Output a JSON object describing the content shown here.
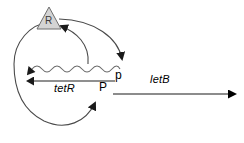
{
  "figure": {
    "kind": "gene-regulatory-network-diagram",
    "background_color": "#ffffff"
  },
  "nodes": {
    "repressor": {
      "label": "R",
      "shape": "triangle",
      "fill_color": "#d4d4d4",
      "stroke_color": "#555555",
      "text_color": "#3a3a3a",
      "name": "repressor-protein-R"
    },
    "promoter": {
      "label": "P",
      "name": "promoter-P"
    },
    "terminator": {
      "label": "q",
      "name": "terminator-symbol"
    }
  },
  "genes": [
    {
      "label": "tetR",
      "style": "italic",
      "line_color": "#8f8f8f",
      "name": "gene-tetR"
    },
    {
      "label": "letB",
      "style": "italic",
      "line_color": "#1a1a1a",
      "name": "gene-letB"
    }
  ],
  "edges": [
    {
      "name": "transcription-wavy-mrna",
      "description": "wavy mRNA transcript line pointing left",
      "color": "#6b6b6b"
    },
    {
      "name": "translation-arc-to-repressor",
      "description": "arc from mRNA up to repressor R",
      "color": "#4a4a4a"
    },
    {
      "name": "repressor-arc-to-terminator",
      "description": "arc from repressor R down to terminator",
      "color": "#4a4a4a"
    },
    {
      "name": "feedback-loop-to-promoter",
      "description": "large circular feedback loop ending with arrow at promoter P",
      "color": "#4a4a4a"
    },
    {
      "name": "letB-transcript-arrow",
      "description": "long straight arrow to the right for letB",
      "color": "#000000"
    }
  ],
  "colors": {
    "line_dark": "#1a1a1a",
    "line_mid": "#4a4a4a",
    "line_gray": "#8f8f8f",
    "triangle_fill": "#d4d4d4"
  }
}
